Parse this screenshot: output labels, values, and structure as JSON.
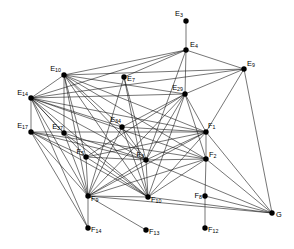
{
  "figure": {
    "width": 294,
    "height": 249,
    "background_color": "#ffffff",
    "edge_color": "#1a1a1a",
    "node_color": "#000000"
  },
  "chart_data": {
    "type": "scatter",
    "title": "",
    "xlabel": "",
    "ylabel": "",
    "grid": false,
    "legend": false,
    "xlim": [
      0,
      294
    ],
    "ylim": [
      0,
      249
    ],
    "nodes": [
      {
        "id": "E3",
        "base": "E",
        "sub": "3",
        "x": 186,
        "y": 21,
        "label_dx": -3,
        "label_dy": -7,
        "label_anchor": "end"
      },
      {
        "id": "E4",
        "base": "E",
        "sub": "4",
        "x": 186,
        "y": 50,
        "label_dx": 4,
        "label_dy": -5,
        "label_anchor": "start"
      },
      {
        "id": "E9",
        "base": "E",
        "sub": "9",
        "x": 244,
        "y": 69,
        "label_dx": 3,
        "label_dy": -5,
        "label_anchor": "start"
      },
      {
        "id": "E10",
        "base": "E",
        "sub": "10",
        "x": 64,
        "y": 75,
        "label_dx": -3,
        "label_dy": -6,
        "label_anchor": "end"
      },
      {
        "id": "E7",
        "base": "E",
        "sub": "7",
        "x": 124,
        "y": 77,
        "label_dx": 3,
        "label_dy": 2,
        "label_anchor": "start"
      },
      {
        "id": "E29",
        "base": "E",
        "sub": "29",
        "x": 185,
        "y": 94,
        "label_dx": -2,
        "label_dy": -6,
        "label_anchor": "end"
      },
      {
        "id": "E14",
        "base": "E",
        "sub": "14",
        "x": 31,
        "y": 98,
        "label_dx": -3,
        "label_dy": -5,
        "label_anchor": "end"
      },
      {
        "id": "E17",
        "base": "E",
        "sub": "17",
        "x": 31,
        "y": 132,
        "label_dx": -3,
        "label_dy": -6,
        "label_anchor": "end"
      },
      {
        "id": "E37",
        "base": "E",
        "sub": "37",
        "x": 64,
        "y": 133,
        "label_dx": -1,
        "label_dy": -6,
        "label_anchor": "end"
      },
      {
        "id": "E34",
        "base": "E",
        "sub": "34",
        "x": 122,
        "y": 127,
        "label_dx": -1,
        "label_dy": -7,
        "label_anchor": "end"
      },
      {
        "id": "F1",
        "base": "F",
        "sub": "1",
        "x": 206,
        "y": 132,
        "label_dx": 2,
        "label_dy": -6,
        "label_anchor": "start"
      },
      {
        "id": "F5",
        "base": "F",
        "sub": "5",
        "x": 86,
        "y": 157,
        "label_dx": -2,
        "label_dy": -5,
        "label_anchor": "end"
      },
      {
        "id": "F3",
        "base": "F",
        "sub": "3",
        "x": 146,
        "y": 160,
        "label_dx": -2,
        "label_dy": -5,
        "label_anchor": "end"
      },
      {
        "id": "F2",
        "base": "F",
        "sub": "2",
        "x": 206,
        "y": 159,
        "label_dx": 3,
        "label_dy": -4,
        "label_anchor": "start"
      },
      {
        "id": "F9",
        "base": "F",
        "sub": "9",
        "x": 88,
        "y": 196,
        "label_dx": 3,
        "label_dy": 3,
        "label_anchor": "start"
      },
      {
        "id": "F10",
        "base": "F",
        "sub": "10",
        "x": 148,
        "y": 197,
        "label_dx": 3,
        "label_dy": 3,
        "label_anchor": "start"
      },
      {
        "id": "F8",
        "base": "F",
        "sub": "8",
        "x": 205,
        "y": 196,
        "label_dx": -3,
        "label_dy": 0,
        "label_anchor": "end"
      },
      {
        "id": "G",
        "base": "G",
        "sub": "",
        "x": 272,
        "y": 213,
        "label_dx": 4,
        "label_dy": 2,
        "label_anchor": "start"
      },
      {
        "id": "F14",
        "base": "F",
        "sub": "14",
        "x": 88,
        "y": 228,
        "label_dx": 3,
        "label_dy": 2,
        "label_anchor": "start"
      },
      {
        "id": "F13",
        "base": "F",
        "sub": "13",
        "x": 146,
        "y": 230,
        "label_dx": 3,
        "label_dy": 2,
        "label_anchor": "start"
      },
      {
        "id": "F12",
        "base": "F",
        "sub": "12",
        "x": 205,
        "y": 228,
        "label_dx": 3,
        "label_dy": 2,
        "label_anchor": "start"
      }
    ],
    "edges": [
      [
        "E3",
        "E4"
      ],
      [
        "E4",
        "E10"
      ],
      [
        "E4",
        "E14"
      ],
      [
        "E4",
        "E9"
      ],
      [
        "E4",
        "E29"
      ],
      [
        "E4",
        "E7"
      ],
      [
        "E4",
        "F3"
      ],
      [
        "E9",
        "E10"
      ],
      [
        "E9",
        "E14"
      ],
      [
        "E9",
        "E29"
      ],
      [
        "E9",
        "G"
      ],
      [
        "E9",
        "F1"
      ],
      [
        "E10",
        "E14"
      ],
      [
        "E10",
        "E29"
      ],
      [
        "E10",
        "E37"
      ],
      [
        "E10",
        "E34"
      ],
      [
        "E10",
        "F1"
      ],
      [
        "E10",
        "F5"
      ],
      [
        "E10",
        "F3"
      ],
      [
        "E10",
        "F9"
      ],
      [
        "E10",
        "F10"
      ],
      [
        "E10",
        "F2"
      ],
      [
        "E7",
        "F3"
      ],
      [
        "E7",
        "F9"
      ],
      [
        "E7",
        "F10"
      ],
      [
        "E29",
        "E14"
      ],
      [
        "E29",
        "E34"
      ],
      [
        "E29",
        "F1"
      ],
      [
        "E29",
        "F3"
      ],
      [
        "E29",
        "F2"
      ],
      [
        "E29",
        "F9"
      ],
      [
        "E29",
        "F10"
      ],
      [
        "E29",
        "F5"
      ],
      [
        "E14",
        "E17"
      ],
      [
        "E14",
        "E37"
      ],
      [
        "E14",
        "E34"
      ],
      [
        "E14",
        "F1"
      ],
      [
        "E14",
        "F5"
      ],
      [
        "E14",
        "F3"
      ],
      [
        "E14",
        "F9"
      ],
      [
        "E14",
        "F10"
      ],
      [
        "E14",
        "F2"
      ],
      [
        "E14",
        "F14"
      ],
      [
        "E17",
        "F5"
      ],
      [
        "E17",
        "F9"
      ],
      [
        "E17",
        "F3"
      ],
      [
        "E17",
        "F10"
      ],
      [
        "E17",
        "F14"
      ],
      [
        "E17",
        "F2"
      ],
      [
        "E17",
        "F1"
      ],
      [
        "E37",
        "F9"
      ],
      [
        "E37",
        "F3"
      ],
      [
        "E37",
        "F10"
      ],
      [
        "E34",
        "F9"
      ],
      [
        "E34",
        "F3"
      ],
      [
        "E34",
        "F10"
      ],
      [
        "E34",
        "F1"
      ],
      [
        "F1",
        "F2"
      ],
      [
        "F1",
        "F3"
      ],
      [
        "F1",
        "F9"
      ],
      [
        "F1",
        "F10"
      ],
      [
        "F1",
        "G"
      ],
      [
        "F1",
        "F5"
      ],
      [
        "F2",
        "F8"
      ],
      [
        "F2",
        "G"
      ],
      [
        "F2",
        "F9"
      ],
      [
        "F2",
        "F10"
      ],
      [
        "F2",
        "F3"
      ],
      [
        "F5",
        "F9"
      ],
      [
        "F5",
        "F3"
      ],
      [
        "F5",
        "F10"
      ],
      [
        "F3",
        "F9"
      ],
      [
        "F3",
        "F10"
      ],
      [
        "F3",
        "G"
      ],
      [
        "F9",
        "F14"
      ],
      [
        "F9",
        "F13"
      ],
      [
        "F9",
        "F10"
      ],
      [
        "F9",
        "G"
      ],
      [
        "F10",
        "G"
      ],
      [
        "F8",
        "F12"
      ],
      [
        "F8",
        "G"
      ]
    ]
  }
}
